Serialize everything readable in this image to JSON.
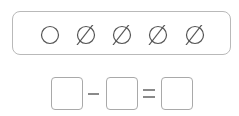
{
  "counting_panel": {
    "items": [
      {
        "symbol": "circle",
        "crossed": false
      },
      {
        "symbol": "circle",
        "crossed": true
      },
      {
        "symbol": "circle",
        "crossed": true
      },
      {
        "symbol": "circle",
        "crossed": true
      },
      {
        "symbol": "circle",
        "crossed": true
      }
    ]
  },
  "equation": {
    "operator": "-",
    "equals": "=",
    "boxes": [
      "",
      "",
      ""
    ]
  },
  "colors": {
    "stroke": "#555555",
    "border": "#b9b9b9"
  }
}
